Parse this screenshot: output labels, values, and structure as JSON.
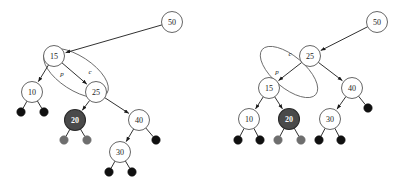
{
  "figure": {
    "background_color": "#ffffff",
    "width": 407,
    "height": 187
  },
  "style": {
    "node_fill": "#ffffff",
    "node_stroke": "#555555",
    "node_text_color": "#1a1a1a",
    "highlight_fill": "#4a4a4a",
    "highlight_stroke": "#2b2b2b",
    "highlight_text_color": "#ffffff",
    "nil_black_fill": "#101010",
    "nil_gray_fill": "#6e6e6e",
    "edge_color": "#1a1a1a",
    "ellipse_stroke": "#6b6b6b",
    "node_radius": 10.5,
    "nil_radius": 4.2
  },
  "panels": [
    {
      "id": "before",
      "name": "left-tree-before-rotation",
      "nodes": [
        {
          "id": "l50",
          "label": "50",
          "x": 172,
          "y": 22,
          "kind": "normal"
        },
        {
          "id": "l15",
          "label": "15",
          "x": 54,
          "y": 56,
          "kind": "normal"
        },
        {
          "id": "l10",
          "label": "10",
          "x": 32,
          "y": 92,
          "kind": "normal"
        },
        {
          "id": "l25",
          "label": "25",
          "x": 96,
          "y": 92,
          "kind": "normal"
        },
        {
          "id": "l20",
          "label": "20",
          "x": 75,
          "y": 120,
          "kind": "highlight"
        },
        {
          "id": "l40",
          "label": "40",
          "x": 139,
          "y": 120,
          "kind": "normal"
        },
        {
          "id": "l30",
          "label": "30",
          "x": 120,
          "y": 152,
          "kind": "normal"
        }
      ],
      "nils": [
        {
          "id": "l10a",
          "x": 21,
          "y": 112,
          "tone": "black"
        },
        {
          "id": "l10b",
          "x": 44,
          "y": 112,
          "tone": "black"
        },
        {
          "id": "l20a",
          "x": 64,
          "y": 140,
          "tone": "gray"
        },
        {
          "id": "l20b",
          "x": 87,
          "y": 140,
          "tone": "gray"
        },
        {
          "id": "l40b",
          "x": 156,
          "y": 140,
          "tone": "black"
        },
        {
          "id": "l30a",
          "x": 109,
          "y": 172,
          "tone": "black"
        },
        {
          "id": "l30b",
          "x": 132,
          "y": 172,
          "tone": "black"
        }
      ],
      "edges": [
        {
          "from": "l50",
          "to": "l15",
          "arrow": true
        },
        {
          "from": "l15",
          "to": "l10",
          "arrow": true
        },
        {
          "from": "l15",
          "to": "l25",
          "arrow": true
        },
        {
          "from": "l25",
          "to": "l20",
          "arrow": true
        },
        {
          "from": "l25",
          "to": "l40",
          "arrow": true
        },
        {
          "from": "l40",
          "to": "l30",
          "arrow": true
        }
      ],
      "pointer_labels": [
        {
          "text": "p",
          "x": 62,
          "y": 74
        },
        {
          "text": "c",
          "x": 90,
          "y": 72
        }
      ],
      "ellipse": {
        "cx": 76,
        "cy": 73,
        "rx": 37,
        "ry": 17,
        "rotate": 33
      }
    },
    {
      "id": "after",
      "name": "right-tree-after-rotation",
      "nodes": [
        {
          "id": "r50",
          "label": "50",
          "x": 377,
          "y": 22,
          "kind": "normal"
        },
        {
          "id": "r25",
          "label": "25",
          "x": 310,
          "y": 56,
          "kind": "normal"
        },
        {
          "id": "r15",
          "label": "15",
          "x": 269,
          "y": 88,
          "kind": "normal"
        },
        {
          "id": "r40",
          "label": "40",
          "x": 352,
          "y": 88,
          "kind": "normal"
        },
        {
          "id": "r10",
          "label": "10",
          "x": 249,
          "y": 119,
          "kind": "normal"
        },
        {
          "id": "r20",
          "label": "20",
          "x": 289,
          "y": 119,
          "kind": "highlight"
        },
        {
          "id": "r30",
          "label": "30",
          "x": 330,
          "y": 119,
          "kind": "normal"
        }
      ],
      "nils": [
        {
          "id": "r10a",
          "x": 238,
          "y": 140,
          "tone": "black"
        },
        {
          "id": "r10b",
          "x": 260,
          "y": 140,
          "tone": "black"
        },
        {
          "id": "r20a",
          "x": 278,
          "y": 140,
          "tone": "gray"
        },
        {
          "id": "r20b",
          "x": 301,
          "y": 140,
          "tone": "gray"
        },
        {
          "id": "r30a",
          "x": 319,
          "y": 140,
          "tone": "black"
        },
        {
          "id": "r30b",
          "x": 341,
          "y": 140,
          "tone": "black"
        },
        {
          "id": "r40b",
          "x": 368,
          "y": 108,
          "tone": "black"
        }
      ],
      "edges": [
        {
          "from": "r50",
          "to": "r25",
          "arrow": true
        },
        {
          "from": "r25",
          "to": "r15",
          "arrow": true
        },
        {
          "from": "r25",
          "to": "r40",
          "arrow": true
        },
        {
          "from": "r15",
          "to": "r10",
          "arrow": true
        },
        {
          "from": "r15",
          "to": "r20",
          "arrow": true
        },
        {
          "from": "r40",
          "to": "r30",
          "arrow": true
        }
      ],
      "pointer_labels": [
        {
          "text": "c",
          "x": 290,
          "y": 54
        },
        {
          "text": "p",
          "x": 277,
          "y": 72
        }
      ],
      "ellipse": {
        "cx": 289,
        "cy": 72,
        "rx": 35,
        "ry": 16,
        "rotate": 40
      }
    }
  ]
}
